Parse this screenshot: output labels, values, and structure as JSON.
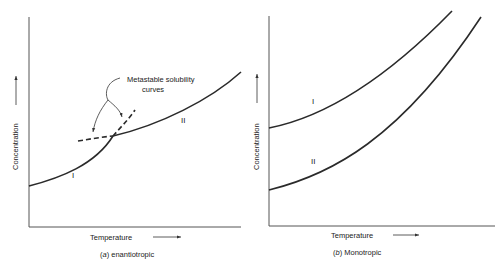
{
  "panels": [
    {
      "id": "a",
      "caption_letter": "a",
      "caption_text": " enantiotropic",
      "xlabel": "Temperature",
      "ylabel": "Concentration",
      "curve_labels": [
        "I",
        "II"
      ],
      "annotation_line1": "Metastable solubility",
      "annotation_line2": "curves"
    },
    {
      "id": "b",
      "caption_letter": "b",
      "caption_text": " Monotropic",
      "xlabel": "Temperature",
      "ylabel": "Concentration",
      "curve_labels": [
        "I",
        "II"
      ]
    }
  ],
  "colors": {
    "line": "#2a2a2a",
    "axis": "#555555",
    "text": "#222222"
  }
}
